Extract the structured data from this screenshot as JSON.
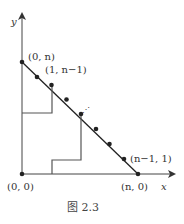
{
  "figure": {
    "caption": "图 2.3",
    "axes": {
      "x_label": "x",
      "y_label": "y"
    },
    "points": {
      "top": "(0, n)",
      "second": "(1, n−1)",
      "near_end": "(n−1, 1)",
      "origin": "(0, 0)",
      "x_end": "(n, 0)"
    },
    "ellipsis": "⋰",
    "colors": {
      "line": "#222222",
      "staircase": "#555555",
      "text": "#333333"
    }
  }
}
